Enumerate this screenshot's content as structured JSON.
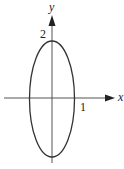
{
  "diagram": {
    "type": "ellipse-graph",
    "equation_shape": "vertical ellipse centered at origin",
    "semi_axis_x": 1,
    "semi_axis_y": 2,
    "labels": {
      "x_axis": "x",
      "y_axis": "y",
      "x_intercept": "1",
      "y_intercept": "2"
    },
    "colors": {
      "stroke": "#333333",
      "axis": "#555555",
      "background": "#ffffff"
    }
  }
}
